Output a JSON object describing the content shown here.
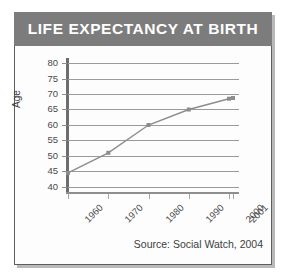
{
  "banner": {
    "title": "LIFE EXPECTANCY AT BIRTH",
    "background_color": "#7c7c7c",
    "text_color": "#ffffff"
  },
  "footer": {
    "source": "Source: Social Watch, 2004"
  },
  "chart_data": {
    "type": "line",
    "title": "LIFE EXPECTANCY AT BIRTH",
    "xlabel": "",
    "ylabel": "Age",
    "categories": [
      "1960",
      "1970",
      "1980",
      "1990",
      "2000",
      "2001"
    ],
    "values": [
      44.5,
      51,
      60,
      65,
      68.5,
      68.7
    ],
    "x_tick_labels": [
      "1960",
      "1970",
      "1980",
      "1990",
      "2000",
      "2001"
    ],
    "y_tick_labels": [
      "40",
      "45",
      "50",
      "55",
      "60",
      "65",
      "70",
      "75",
      "80"
    ],
    "y_ticks": [
      40,
      45,
      50,
      55,
      60,
      65,
      70,
      75,
      80
    ],
    "ylim": [
      38,
      81
    ],
    "grid": true,
    "grid_axis": "y",
    "legend": false,
    "legend_position": "none",
    "series_color": "#8c8c8c",
    "marker": "square",
    "annotations": [
      "Source: Social Watch, 2004"
    ]
  }
}
